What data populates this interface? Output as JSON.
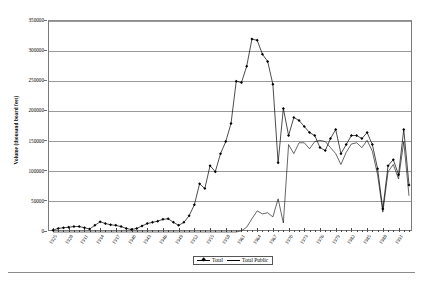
{
  "chart_data": {
    "type": "line",
    "title": "",
    "xlabel": "",
    "ylabel": "Volume (thousand board feet)",
    "ylim": [
      0,
      350000
    ],
    "ytick_labels": [
      "0",
      "50000",
      "100000",
      "150000",
      "200000",
      "250000",
      "300000",
      "350000"
    ],
    "ytick_values": [
      0,
      50000,
      100000,
      150000,
      200000,
      250000,
      300000,
      350000
    ],
    "grid": true,
    "legend_position": "bottom-center",
    "x": [
      1925,
      1926,
      1927,
      1928,
      1929,
      1930,
      1931,
      1932,
      1933,
      1934,
      1935,
      1936,
      1937,
      1938,
      1939,
      1940,
      1941,
      1942,
      1943,
      1944,
      1945,
      1946,
      1947,
      1948,
      1949,
      1950,
      1951,
      1952,
      1953,
      1954,
      1955,
      1956,
      1957,
      1958,
      1959,
      1960,
      1961,
      1962,
      1963,
      1964,
      1965,
      1966,
      1967,
      1968,
      1969,
      1970,
      1971,
      1972,
      1973,
      1974,
      1975,
      1976,
      1977,
      1978,
      1979,
      1980,
      1981,
      1982,
      1983,
      1984,
      1985,
      1986,
      1987,
      1988,
      1989,
      1990,
      1991,
      1992,
      1993
    ],
    "xtick_labels": [
      "1925",
      "1928",
      "1931",
      "1934",
      "1937",
      "1940",
      "1943",
      "1946",
      "1949",
      "1952",
      "1955",
      "1958",
      "1961",
      "1964",
      "1967",
      "1970",
      "1973",
      "1976",
      "1979",
      "1982",
      "1985",
      "1988",
      "1991"
    ],
    "xtick_values": [
      1925,
      1928,
      1931,
      1934,
      1937,
      1940,
      1943,
      1946,
      1949,
      1952,
      1955,
      1958,
      1961,
      1964,
      1967,
      1970,
      1973,
      1976,
      1979,
      1982,
      1985,
      1988,
      1991
    ],
    "series": [
      {
        "name": "Total",
        "marker": "diamond",
        "values": [
          3000,
          6000,
          7000,
          8000,
          9000,
          9000,
          7000,
          5000,
          11000,
          17000,
          14000,
          12000,
          11000,
          9000,
          6000,
          4000,
          6000,
          10000,
          14000,
          16000,
          18000,
          21000,
          22000,
          16000,
          11000,
          16000,
          27000,
          45000,
          80000,
          72000,
          110000,
          100000,
          130000,
          150000,
          180000,
          250000,
          248000,
          275000,
          320000,
          318000,
          295000,
          283000,
          245000,
          115000,
          205000,
          160000,
          190000,
          185000,
          175000,
          165000,
          160000,
          140000,
          135000,
          155000,
          170000,
          130000,
          145000,
          160000,
          160000,
          155000,
          165000,
          145000,
          105000,
          38000,
          110000,
          120000,
          95000,
          170000,
          78000
        ],
        "marker_color": "#000000",
        "line_color": "#000000"
      },
      {
        "name": "Total Public",
        "marker": "none",
        "values": [
          0,
          0,
          0,
          0,
          0,
          0,
          0,
          0,
          0,
          0,
          0,
          0,
          0,
          0,
          0,
          0,
          0,
          0,
          0,
          0,
          0,
          0,
          0,
          0,
          0,
          0,
          0,
          0,
          0,
          0,
          0,
          0,
          0,
          0,
          0,
          0,
          2000,
          8000,
          22000,
          35000,
          30000,
          32000,
          25000,
          55000,
          15000,
          145000,
          130000,
          148000,
          148000,
          138000,
          150000,
          152000,
          150000,
          140000,
          130000,
          112000,
          132000,
          146000,
          148000,
          140000,
          152000,
          134000,
          95000,
          33000,
          100000,
          112000,
          88000,
          150000,
          60000
        ],
        "line_color": "#000000"
      }
    ]
  },
  "legend": {
    "items": [
      {
        "label": "Total"
      },
      {
        "label": "Total Public"
      }
    ]
  },
  "axis": {
    "y_title": "Volume (thousand board feet)"
  }
}
